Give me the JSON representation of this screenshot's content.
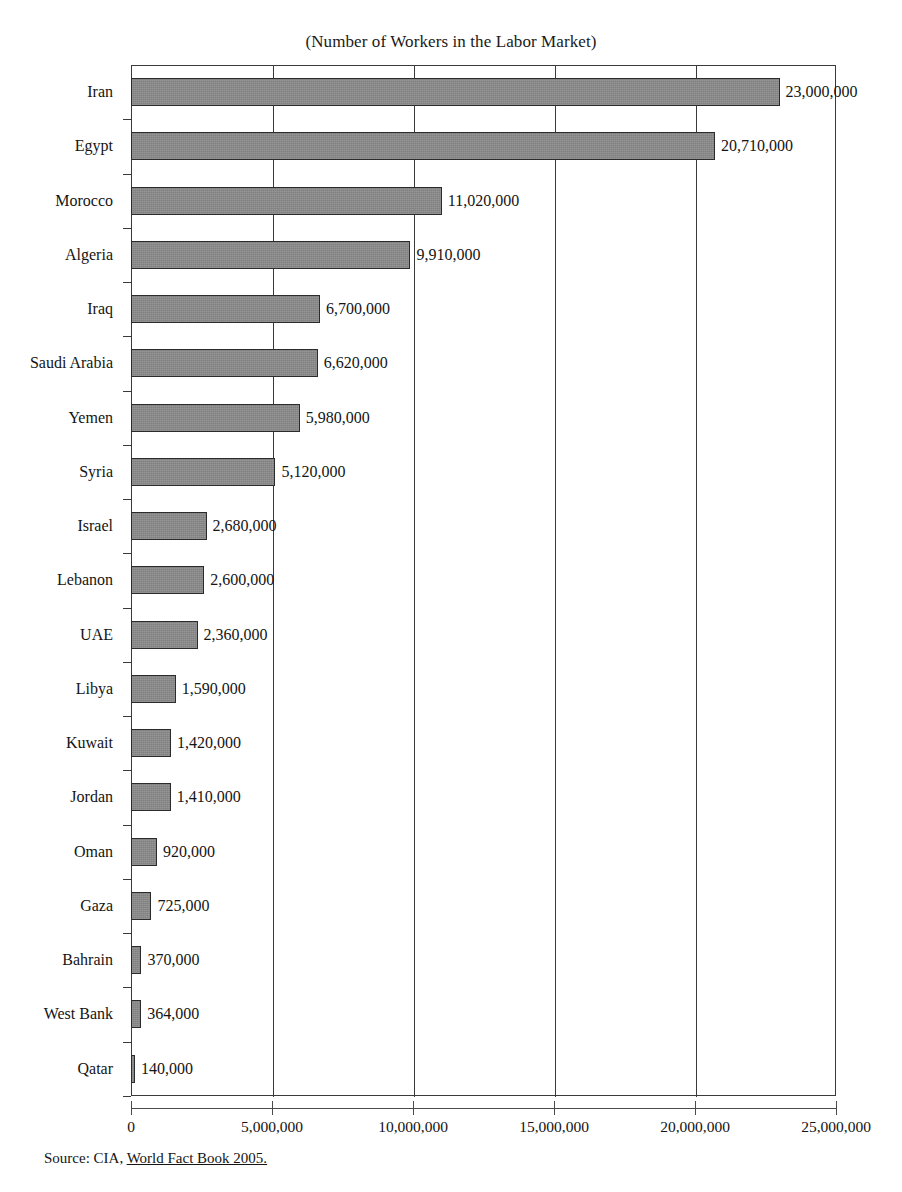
{
  "chart_data": {
    "type": "bar",
    "orientation": "horizontal",
    "title": "(Number of Workers in the Labor Market)",
    "xlabel": "",
    "ylabel": "",
    "xlim": [
      0,
      25000000
    ],
    "grid": true,
    "legend": null,
    "tick_step": 5000000,
    "tick_labels": [
      "0",
      "5,000,000",
      "10,000,000",
      "15,000,000",
      "20,000,000",
      "25,000,000"
    ],
    "tick_values": [
      0,
      5000000,
      10000000,
      15000000,
      20000000,
      25000000
    ],
    "categories": [
      "Iran",
      "Egypt",
      "Morocco",
      "Algeria",
      "Iraq",
      "Saudi Arabia",
      "Yemen",
      "Syria",
      "Israel",
      "Lebanon",
      "UAE",
      "Libya",
      "Kuwait",
      "Jordan",
      "Oman",
      "Gaza",
      "Bahrain",
      "West Bank",
      "Qatar"
    ],
    "values": [
      23000000,
      20710000,
      11020000,
      9910000,
      6700000,
      6620000,
      5980000,
      5120000,
      2680000,
      2600000,
      2360000,
      1590000,
      1420000,
      1410000,
      920000,
      725000,
      370000,
      364000,
      140000
    ],
    "value_labels": [
      "23,000,000",
      "20,710,000",
      "11,020,000",
      "9,910,000",
      "6,700,000",
      "6,620,000",
      "5,980,000",
      "5,120,000",
      "2,680,000",
      "2,600,000",
      "2,360,000",
      "1,590,000",
      "1,420,000",
      "1,410,000",
      "920,000",
      "725,000",
      "370,000",
      "364,000",
      "140,000"
    ],
    "bar_color": "#808080",
    "bar_border_color": "#2b2b2b",
    "axis_color": "#3a3a3a"
  },
  "source": {
    "prefix": "Source: CIA, ",
    "emphasis": "World Fact Book 2005."
  }
}
